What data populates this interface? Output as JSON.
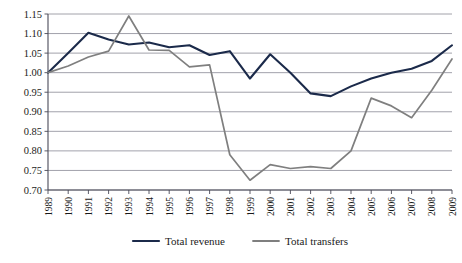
{
  "chart_data": {
    "type": "line",
    "title": "",
    "subtitle": "",
    "xlabel": "",
    "ylabel": "",
    "grid": true,
    "legend_position": "bottom",
    "categories": [
      "1989",
      "1990",
      "1991",
      "1992",
      "1993",
      "1994",
      "1995",
      "1996",
      "1997",
      "1998",
      "1999",
      "2000",
      "2001",
      "2002",
      "2003",
      "2004",
      "2005",
      "2006",
      "2007",
      "2008",
      "2009"
    ],
    "x": [
      1989,
      1990,
      1991,
      1992,
      1993,
      1994,
      1995,
      1996,
      1997,
      1998,
      1999,
      2000,
      2001,
      2002,
      2003,
      2004,
      2005,
      2006,
      2007,
      2008,
      2009
    ],
    "ylim": [
      0.7,
      1.15
    ],
    "yticks": [
      0.7,
      0.75,
      0.8,
      0.85,
      0.9,
      0.95,
      1.0,
      1.05,
      1.1,
      1.15
    ],
    "ytick_labels": [
      "0.70",
      "0.75",
      "0.80",
      "0.85",
      "0.90",
      "0.95",
      "1.00",
      "1.05",
      "1.10",
      "1.15"
    ],
    "series": [
      {
        "name": "Total revenue",
        "color": "#1b2a4a",
        "values": [
          1.0,
          1.05,
          1.102,
          1.085,
          1.072,
          1.077,
          1.065,
          1.07,
          1.045,
          1.055,
          0.985,
          1.047,
          1.0,
          0.947,
          0.94,
          0.965,
          0.985,
          1.0,
          1.01,
          1.03,
          1.07
        ]
      },
      {
        "name": "Total transfers",
        "color": "#7f7f7f",
        "values": [
          1.0,
          1.017,
          1.04,
          1.055,
          1.145,
          1.058,
          1.057,
          1.015,
          1.02,
          0.79,
          0.725,
          0.765,
          0.755,
          0.76,
          0.755,
          0.8,
          0.935,
          0.915,
          0.885,
          0.955,
          1.035
        ]
      }
    ]
  },
  "legend": {
    "entries": [
      {
        "label": "Total revenue",
        "color": "#1b2a4a"
      },
      {
        "label": "Total transfers",
        "color": "#7f7f7f"
      }
    ]
  }
}
